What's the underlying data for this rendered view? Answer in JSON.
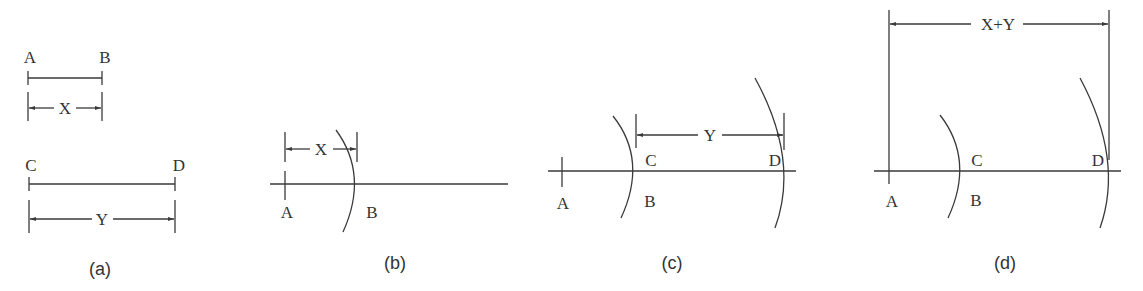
{
  "figure": {
    "panels": [
      {
        "caption": "(a)",
        "segments": [
          {
            "start_label": "A",
            "end_label": "B",
            "dimension": "X"
          },
          {
            "start_label": "C",
            "end_label": "D",
            "dimension": "Y"
          }
        ]
      },
      {
        "caption": "(b)",
        "points": [
          "A",
          "B"
        ],
        "dimension": "X"
      },
      {
        "caption": "(c)",
        "points": [
          "A",
          "B",
          "C",
          "D"
        ],
        "dimension": "Y"
      },
      {
        "caption": "(d)",
        "points": [
          "A",
          "B",
          "C",
          "D"
        ],
        "dimension": "X+Y"
      }
    ]
  }
}
